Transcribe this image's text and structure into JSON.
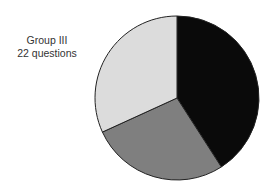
{
  "chart_data": {
    "type": "pie",
    "title": "Group III",
    "subtitle": "22 questions",
    "slices": [
      {
        "name": "Slice 1",
        "value": 9,
        "color": "#0a0a0a"
      },
      {
        "name": "Slice 2",
        "value": 6,
        "color": "#7f7f7f"
      },
      {
        "name": "Slice 3",
        "value": 7,
        "color": "#dcdcdc"
      }
    ],
    "total": 22,
    "start_angle_deg": 0,
    "direction": "clockwise",
    "legend": "none"
  },
  "label": {
    "line1": "Group III",
    "line2": "22 questions"
  }
}
